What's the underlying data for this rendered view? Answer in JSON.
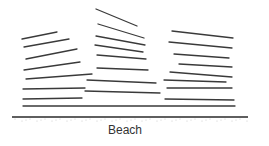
{
  "diagram": {
    "label": "Beach",
    "colors": {
      "wave": "#3a3a3a",
      "shore": "#2a2a2a",
      "background": "#ffffff"
    },
    "shoreline": {
      "x1": 12,
      "y1": 117,
      "x2": 248,
      "y2": 117
    },
    "wave_groups": [
      {
        "name": "left",
        "lines": [
          [
            22,
            39,
            57,
            32
          ],
          [
            24,
            47,
            69,
            39
          ],
          [
            26,
            59,
            77,
            49
          ],
          [
            24,
            70,
            80,
            62
          ],
          [
            26,
            79,
            92,
            74
          ],
          [
            23,
            89,
            85,
            88
          ],
          [
            23,
            99,
            82,
            98
          ]
        ]
      },
      {
        "name": "middle",
        "lines": [
          [
            96,
            9,
            137,
            26
          ],
          [
            98,
            24,
            144,
            38
          ],
          [
            96,
            36,
            145,
            45
          ],
          [
            95,
            45,
            143,
            52
          ],
          [
            97,
            55,
            146,
            59
          ],
          [
            97,
            68,
            148,
            70
          ],
          [
            87,
            80,
            156,
            83
          ],
          [
            85,
            91,
            160,
            93
          ]
        ]
      },
      {
        "name": "right",
        "lines": [
          [
            172,
            31,
            233,
            38
          ],
          [
            169,
            42,
            232,
            48
          ],
          [
            174,
            54,
            229,
            58
          ],
          [
            179,
            64,
            232,
            67
          ],
          [
            170,
            72,
            232,
            77
          ],
          [
            164,
            80,
            226,
            82
          ],
          [
            167,
            88,
            232,
            88
          ],
          [
            165,
            99,
            234,
            100
          ]
        ]
      },
      {
        "name": "front",
        "lines": [
          [
            23,
            106,
            235,
            106
          ]
        ]
      }
    ]
  }
}
